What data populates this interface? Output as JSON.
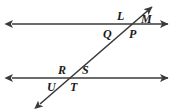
{
  "figure": {
    "stroke_color": "#3a3a3a",
    "label_color": "#1b1b1b",
    "background_color": "#ffffff"
  },
  "lines": [
    {
      "name": "upper-parallel-line",
      "orientation": "horizontal",
      "x1": 9,
      "y1": 24,
      "x2": 171,
      "y2": 24,
      "arrow_start": true,
      "arrow_end": true
    },
    {
      "name": "lower-parallel-line",
      "orientation": "horizontal",
      "x1": 9,
      "y1": 78,
      "x2": 171,
      "y2": 78,
      "arrow_start": true,
      "arrow_end": true
    },
    {
      "name": "transversal-line",
      "orientation": "diagonal",
      "x1": 37,
      "y1": 107,
      "x2": 155,
      "y2": 5,
      "arrow_start": true,
      "arrow_end": true
    }
  ],
  "intersections": [
    {
      "name": "upper-intersection",
      "x": 126,
      "y": 24
    },
    {
      "name": "lower-intersection",
      "x": 71,
      "y": 78
    }
  ],
  "labels": [
    {
      "id": "L",
      "text": "L",
      "x": 117,
      "y": 10,
      "position": "upper-left-of-upper-intersection"
    },
    {
      "id": "M",
      "text": "M",
      "x": 141,
      "y": 13,
      "position": "upper-right-of-upper-intersection"
    },
    {
      "id": "Q",
      "text": "Q",
      "x": 103,
      "y": 28,
      "position": "lower-left-of-upper-intersection"
    },
    {
      "id": "P",
      "text": "P",
      "x": 129,
      "y": 28,
      "position": "lower-right-of-upper-intersection"
    },
    {
      "id": "R",
      "text": "R",
      "x": 58,
      "y": 64,
      "position": "upper-left-of-lower-intersection"
    },
    {
      "id": "S",
      "text": "S",
      "x": 82,
      "y": 64,
      "position": "upper-right-of-lower-intersection"
    },
    {
      "id": "U",
      "text": "U",
      "x": 47,
      "y": 81,
      "position": "lower-left-of-lower-intersection"
    },
    {
      "id": "T",
      "text": "T",
      "x": 70,
      "y": 81,
      "position": "lower-right-of-lower-intersection"
    }
  ]
}
